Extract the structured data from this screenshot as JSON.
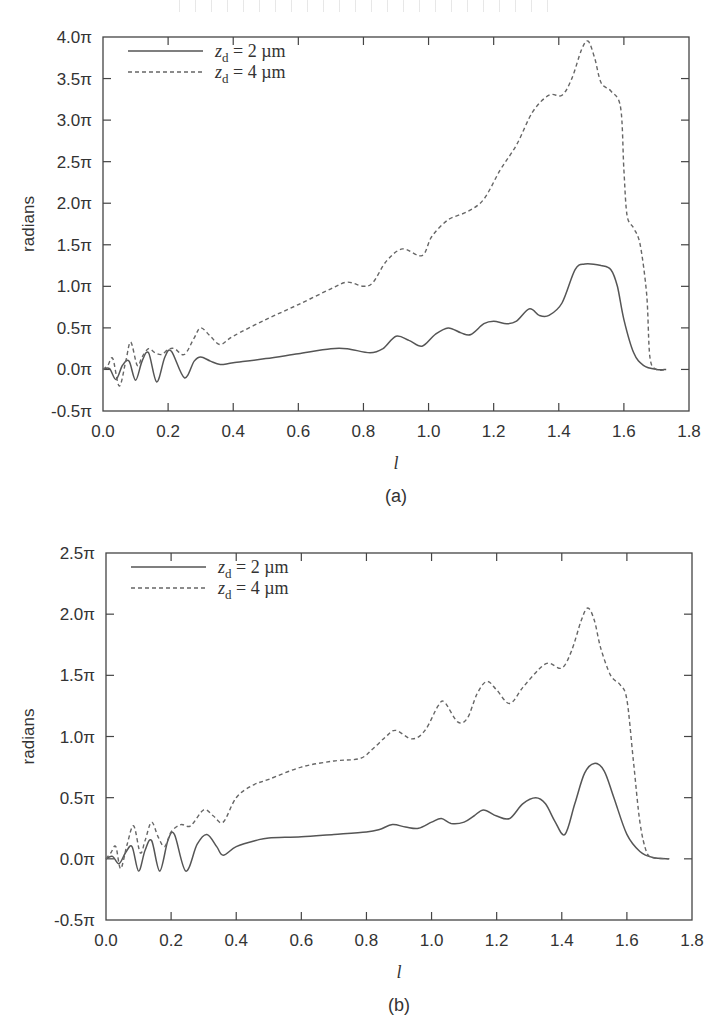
{
  "chart_data": [
    {
      "id": "a",
      "type": "line",
      "caption": "(a)",
      "title": "",
      "xlabel": "l",
      "ylabel": "radians",
      "xlim": [
        0.0,
        1.8
      ],
      "ylim": [
        -0.5,
        4.0
      ],
      "y_unit": "π",
      "x_ticks": [
        "0.0",
        "0.2",
        "0.4",
        "0.6",
        "0.8",
        "1.0",
        "1.2",
        "1.4",
        "1.6",
        "1.8"
      ],
      "y_ticks": [
        "-0.5π",
        "0.0π",
        "0.5π",
        "1.0π",
        "1.5π",
        "2.0π",
        "2.5π",
        "3.0π",
        "3.5π",
        "4.0π"
      ],
      "grid": false,
      "legend_position": "upper-left",
      "frame_px": {
        "x0": 103,
        "x1": 689,
        "y_top": 37,
        "y_bottom": 411
      },
      "series": [
        {
          "name": "z_d = 2 µm",
          "style": "solid",
          "points": [
            [
              0.0,
              0.0
            ],
            [
              0.02,
              0.01
            ],
            [
              0.04,
              -0.12
            ],
            [
              0.06,
              0.05
            ],
            [
              0.08,
              0.1
            ],
            [
              0.1,
              -0.13
            ],
            [
              0.12,
              0.1
            ],
            [
              0.14,
              0.2
            ],
            [
              0.165,
              -0.15
            ],
            [
              0.19,
              0.15
            ],
            [
              0.21,
              0.22
            ],
            [
              0.25,
              -0.1
            ],
            [
              0.28,
              0.1
            ],
            [
              0.3,
              0.15
            ],
            [
              0.33,
              0.1
            ],
            [
              0.36,
              0.06
            ],
            [
              0.4,
              0.08
            ],
            [
              0.5,
              0.13
            ],
            [
              0.6,
              0.19
            ],
            [
              0.7,
              0.25
            ],
            [
              0.75,
              0.25
            ],
            [
              0.82,
              0.2
            ],
            [
              0.86,
              0.25
            ],
            [
              0.9,
              0.4
            ],
            [
              0.94,
              0.35
            ],
            [
              0.98,
              0.28
            ],
            [
              1.02,
              0.42
            ],
            [
              1.06,
              0.5
            ],
            [
              1.1,
              0.44
            ],
            [
              1.13,
              0.42
            ],
            [
              1.17,
              0.55
            ],
            [
              1.2,
              0.58
            ],
            [
              1.24,
              0.55
            ],
            [
              1.27,
              0.58
            ],
            [
              1.31,
              0.73
            ],
            [
              1.34,
              0.65
            ],
            [
              1.37,
              0.65
            ],
            [
              1.41,
              0.8
            ],
            [
              1.45,
              1.2
            ],
            [
              1.48,
              1.27
            ],
            [
              1.53,
              1.25
            ],
            [
              1.56,
              1.2
            ],
            [
              1.58,
              1.0
            ],
            [
              1.6,
              0.6
            ],
            [
              1.63,
              0.2
            ],
            [
              1.66,
              0.05
            ],
            [
              1.7,
              0.0
            ],
            [
              1.73,
              0.0
            ]
          ]
        },
        {
          "name": "z_d = 4 µm",
          "style": "dashed",
          "points": [
            [
              0.0,
              0.0
            ],
            [
              0.015,
              0.05
            ],
            [
              0.03,
              0.13
            ],
            [
              0.05,
              -0.2
            ],
            [
              0.07,
              0.1
            ],
            [
              0.085,
              0.33
            ],
            [
              0.105,
              0.05
            ],
            [
              0.12,
              0.15
            ],
            [
              0.14,
              0.25
            ],
            [
              0.16,
              0.2
            ],
            [
              0.18,
              0.18
            ],
            [
              0.2,
              0.24
            ],
            [
              0.22,
              0.25
            ],
            [
              0.25,
              0.18
            ],
            [
              0.28,
              0.38
            ],
            [
              0.3,
              0.5
            ],
            [
              0.33,
              0.4
            ],
            [
              0.36,
              0.3
            ],
            [
              0.4,
              0.4
            ],
            [
              0.5,
              0.6
            ],
            [
              0.6,
              0.78
            ],
            [
              0.7,
              0.97
            ],
            [
              0.75,
              1.05
            ],
            [
              0.8,
              1.0
            ],
            [
              0.83,
              1.05
            ],
            [
              0.87,
              1.3
            ],
            [
              0.92,
              1.45
            ],
            [
              0.98,
              1.37
            ],
            [
              1.01,
              1.6
            ],
            [
              1.06,
              1.8
            ],
            [
              1.12,
              1.9
            ],
            [
              1.17,
              2.05
            ],
            [
              1.22,
              2.4
            ],
            [
              1.27,
              2.7
            ],
            [
              1.32,
              3.1
            ],
            [
              1.37,
              3.3
            ],
            [
              1.41,
              3.3
            ],
            [
              1.44,
              3.5
            ],
            [
              1.47,
              3.85
            ],
            [
              1.49,
              3.95
            ],
            [
              1.51,
              3.75
            ],
            [
              1.53,
              3.45
            ],
            [
              1.56,
              3.35
            ],
            [
              1.59,
              3.15
            ],
            [
              1.6,
              2.4
            ],
            [
              1.61,
              1.85
            ],
            [
              1.63,
              1.7
            ],
            [
              1.65,
              1.5
            ],
            [
              1.67,
              0.9
            ],
            [
              1.68,
              0.15
            ],
            [
              1.7,
              0.0
            ],
            [
              1.73,
              0.0
            ]
          ]
        }
      ]
    },
    {
      "id": "b",
      "type": "line",
      "caption": "(b)",
      "title": "",
      "xlabel": "l",
      "ylabel": "radians",
      "xlim": [
        0.0,
        1.8
      ],
      "ylim": [
        -0.5,
        2.5
      ],
      "y_unit": "π",
      "x_ticks": [
        "0.0",
        "0.2",
        "0.4",
        "0.6",
        "0.8",
        "1.0",
        "1.2",
        "1.4",
        "1.6",
        "1.8"
      ],
      "y_ticks": [
        "-0.5π",
        "0.0π",
        "0.5π",
        "1.0π",
        "1.5π",
        "2.0π",
        "2.5π"
      ],
      "grid": false,
      "legend_position": "upper-left",
      "frame_px": {
        "x0": 106,
        "x1": 692,
        "y_top": 553,
        "y_bottom": 920
      },
      "series": [
        {
          "name": "z_d = 2 µm",
          "style": "solid",
          "points": [
            [
              0.0,
              0.0
            ],
            [
              0.02,
              0.02
            ],
            [
              0.04,
              -0.04
            ],
            [
              0.06,
              0.05
            ],
            [
              0.08,
              0.1
            ],
            [
              0.1,
              -0.1
            ],
            [
              0.12,
              0.07
            ],
            [
              0.14,
              0.15
            ],
            [
              0.165,
              -0.1
            ],
            [
              0.19,
              0.15
            ],
            [
              0.21,
              0.2
            ],
            [
              0.245,
              -0.1
            ],
            [
              0.28,
              0.12
            ],
            [
              0.31,
              0.2
            ],
            [
              0.34,
              0.1
            ],
            [
              0.36,
              0.03
            ],
            [
              0.4,
              0.1
            ],
            [
              0.46,
              0.15
            ],
            [
              0.5,
              0.17
            ],
            [
              0.6,
              0.18
            ],
            [
              0.7,
              0.2
            ],
            [
              0.8,
              0.22
            ],
            [
              0.84,
              0.24
            ],
            [
              0.88,
              0.28
            ],
            [
              0.92,
              0.26
            ],
            [
              0.96,
              0.25
            ],
            [
              1.0,
              0.3
            ],
            [
              1.03,
              0.33
            ],
            [
              1.06,
              0.29
            ],
            [
              1.1,
              0.3
            ],
            [
              1.13,
              0.35
            ],
            [
              1.16,
              0.4
            ],
            [
              1.2,
              0.35
            ],
            [
              1.24,
              0.33
            ],
            [
              1.28,
              0.45
            ],
            [
              1.32,
              0.5
            ],
            [
              1.35,
              0.45
            ],
            [
              1.38,
              0.3
            ],
            [
              1.41,
              0.2
            ],
            [
              1.44,
              0.45
            ],
            [
              1.47,
              0.7
            ],
            [
              1.5,
              0.78
            ],
            [
              1.53,
              0.72
            ],
            [
              1.56,
              0.5
            ],
            [
              1.6,
              0.2
            ],
            [
              1.64,
              0.06
            ],
            [
              1.68,
              0.01
            ],
            [
              1.73,
              0.0
            ]
          ]
        },
        {
          "name": "z_d = 4 µm",
          "style": "dashed",
          "points": [
            [
              0.0,
              0.0
            ],
            [
              0.015,
              0.05
            ],
            [
              0.03,
              0.1
            ],
            [
              0.045,
              -0.08
            ],
            [
              0.065,
              0.12
            ],
            [
              0.085,
              0.27
            ],
            [
              0.105,
              0.05
            ],
            [
              0.12,
              0.15
            ],
            [
              0.14,
              0.3
            ],
            [
              0.16,
              0.18
            ],
            [
              0.18,
              0.1
            ],
            [
              0.2,
              0.22
            ],
            [
              0.23,
              0.28
            ],
            [
              0.26,
              0.27
            ],
            [
              0.3,
              0.4
            ],
            [
              0.33,
              0.35
            ],
            [
              0.36,
              0.3
            ],
            [
              0.4,
              0.5
            ],
            [
              0.45,
              0.6
            ],
            [
              0.5,
              0.65
            ],
            [
              0.6,
              0.75
            ],
            [
              0.7,
              0.8
            ],
            [
              0.78,
              0.82
            ],
            [
              0.82,
              0.9
            ],
            [
              0.86,
              1.0
            ],
            [
              0.89,
              1.05
            ],
            [
              0.94,
              0.98
            ],
            [
              0.98,
              1.05
            ],
            [
              1.02,
              1.25
            ],
            [
              1.04,
              1.28
            ],
            [
              1.08,
              1.12
            ],
            [
              1.11,
              1.15
            ],
            [
              1.14,
              1.35
            ],
            [
              1.17,
              1.45
            ],
            [
              1.2,
              1.38
            ],
            [
              1.24,
              1.27
            ],
            [
              1.28,
              1.4
            ],
            [
              1.33,
              1.55
            ],
            [
              1.36,
              1.6
            ],
            [
              1.4,
              1.56
            ],
            [
              1.43,
              1.7
            ],
            [
              1.46,
              1.95
            ],
            [
              1.48,
              2.05
            ],
            [
              1.5,
              1.95
            ],
            [
              1.52,
              1.72
            ],
            [
              1.55,
              1.5
            ],
            [
              1.58,
              1.42
            ],
            [
              1.6,
              1.3
            ],
            [
              1.62,
              0.8
            ],
            [
              1.64,
              0.3
            ],
            [
              1.66,
              0.06
            ],
            [
              1.68,
              0.01
            ],
            [
              1.73,
              0.0
            ]
          ]
        }
      ]
    }
  ],
  "legend": {
    "items": [
      {
        "sym": "z",
        "sub": "d",
        "rest": " = 2 µm",
        "style": "solid"
      },
      {
        "sym": "z",
        "sub": "d",
        "rest": " = 4 µm",
        "style": "dashed"
      }
    ]
  }
}
